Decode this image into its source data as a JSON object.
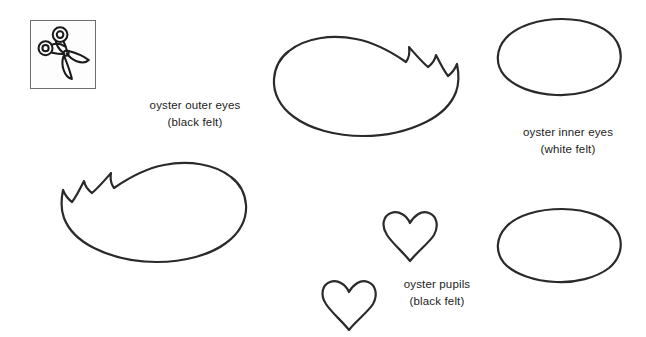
{
  "page": {
    "background_color": "#ffffff",
    "width": 646,
    "height": 337
  },
  "icon": {
    "name": "scissors-icon",
    "meaning": "cut-out-along-lines",
    "border_color": "#6e6e6e",
    "fill_color": "#fdfdfd",
    "stroke_color": "#1a1a1a"
  },
  "faint_header": {
    "text": ""
  },
  "labels": [
    {
      "id": "outer-eyes",
      "line1": "oyster outer eyes",
      "line2": "(black felt)"
    },
    {
      "id": "inner-eyes",
      "line1": "oyster inner eyes",
      "line2": "(white felt)"
    },
    {
      "id": "pupils",
      "line1": "oyster pupils",
      "line2": "(black felt)"
    }
  ],
  "shapes": {
    "stroke_color": "#2a2a2a",
    "fill_color": "#ffffff",
    "pieces": [
      {
        "name": "outer-eye-right",
        "type": "lashed-eye",
        "lashes": 3,
        "orientation": "lashes-right"
      },
      {
        "name": "outer-eye-left",
        "type": "lashed-eye",
        "lashes": 3,
        "orientation": "lashes-left"
      },
      {
        "name": "inner-eye-top",
        "type": "oval"
      },
      {
        "name": "inner-eye-bottom",
        "type": "oval"
      },
      {
        "name": "pupil-upper",
        "type": "heart"
      },
      {
        "name": "pupil-lower",
        "type": "heart"
      }
    ]
  }
}
